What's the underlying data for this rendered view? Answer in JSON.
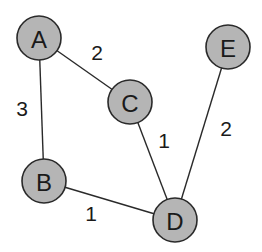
{
  "graph": {
    "nodes": [
      {
        "id": "A",
        "label": "A",
        "x": 39,
        "y": 38
      },
      {
        "id": "B",
        "label": "B",
        "x": 44,
        "y": 181
      },
      {
        "id": "C",
        "label": "C",
        "x": 130,
        "y": 102
      },
      {
        "id": "D",
        "label": "D",
        "x": 175,
        "y": 220
      },
      {
        "id": "E",
        "label": "E",
        "x": 228,
        "y": 47
      }
    ],
    "edges": [
      {
        "from": "A",
        "to": "C",
        "weight": "2",
        "label_x": 97,
        "label_y": 52
      },
      {
        "from": "A",
        "to": "B",
        "weight": "3",
        "label_x": 22,
        "label_y": 108
      },
      {
        "from": "C",
        "to": "D",
        "weight": "1",
        "label_x": 164,
        "label_y": 140
      },
      {
        "from": "E",
        "to": "D",
        "weight": "2",
        "label_x": 226,
        "label_y": 128
      },
      {
        "from": "B",
        "to": "D",
        "weight": "1",
        "label_x": 91,
        "label_y": 213
      }
    ],
    "node_radius": 22,
    "colors": {
      "node_fill": "#b5b5b5",
      "stroke": "#2a2a2a"
    }
  }
}
